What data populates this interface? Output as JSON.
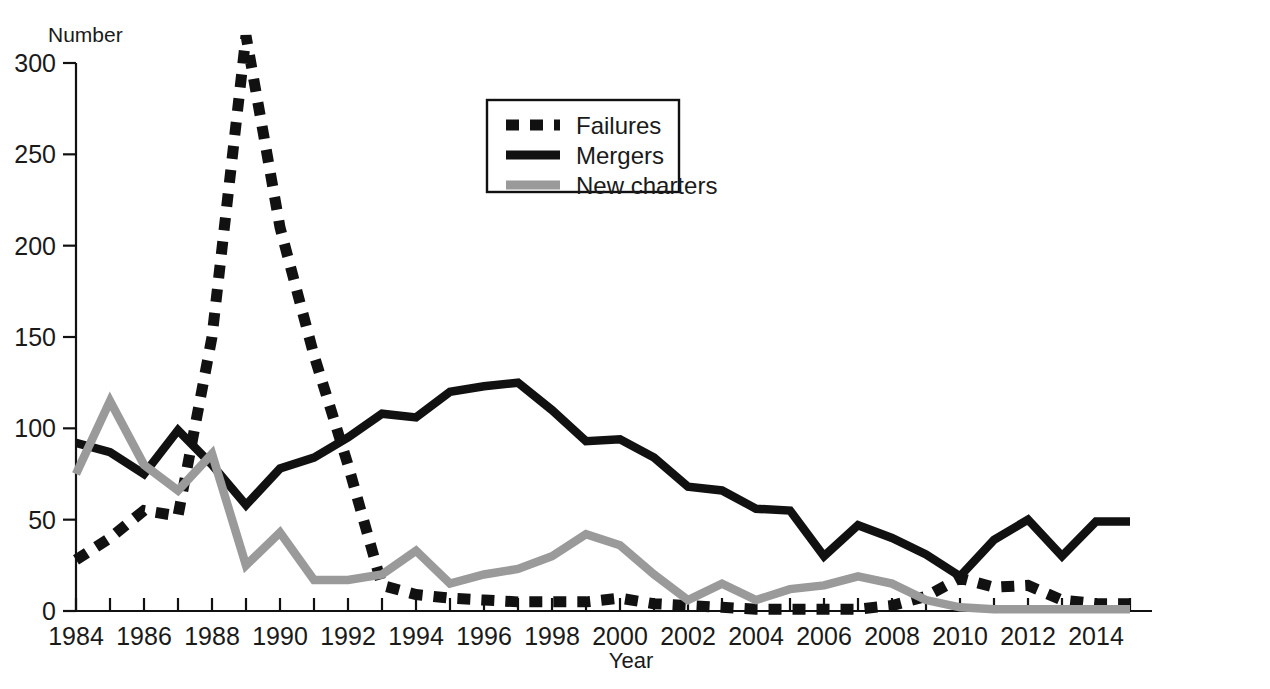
{
  "chart_data": {
    "type": "line",
    "title": "",
    "xlabel": "Year",
    "ylabel": "Number",
    "xlim": [
      1984,
      2015
    ],
    "ylim": [
      0,
      300
    ],
    "ytick_values": [
      0,
      50,
      100,
      150,
      200,
      250,
      300
    ],
    "ytick_labels": [
      "0",
      "50",
      "100",
      "150",
      "200",
      "250",
      "300"
    ],
    "xtick_values": [
      1984,
      1985,
      1986,
      1987,
      1988,
      1989,
      1990,
      1991,
      1992,
      1993,
      1994,
      1995,
      1996,
      1997,
      1998,
      1999,
      2000,
      2001,
      2002,
      2003,
      2004,
      2005,
      2006,
      2007,
      2008,
      2009,
      2010,
      2011,
      2012,
      2013,
      2014,
      2015
    ],
    "xtick_labels_shown": [
      "1984",
      "1986",
      "1988",
      "1990",
      "1992",
      "1994",
      "1996",
      "1998",
      "2000",
      "2002",
      "2004",
      "2006",
      "2008",
      "2010",
      "2012",
      "2014"
    ],
    "grid": false,
    "legend_position": "upper-center-left",
    "x": [
      1984,
      1985,
      1986,
      1987,
      1988,
      1989,
      1990,
      1991,
      1992,
      1993,
      1994,
      1995,
      1996,
      1997,
      1998,
      1999,
      2000,
      2001,
      2002,
      2003,
      2004,
      2005,
      2006,
      2007,
      2008,
      2009,
      2010,
      2011,
      2012,
      2013,
      2014,
      2015
    ],
    "series": [
      {
        "name": "Failures",
        "color": "#111111",
        "style": "dashed",
        "values": [
          28,
          40,
          55,
          52,
          150,
          315,
          210,
          140,
          80,
          14,
          9,
          7,
          6,
          5,
          5,
          5,
          7,
          4,
          3,
          2,
          1,
          1,
          1,
          1,
          3,
          8,
          18,
          13,
          14,
          6,
          4,
          4
        ]
      },
      {
        "name": "Mergers",
        "color": "#111111",
        "style": "solid",
        "values": [
          92,
          87,
          75,
          99,
          80,
          58,
          78,
          84,
          95,
          108,
          106,
          120,
          123,
          125,
          110,
          93,
          94,
          84,
          68,
          66,
          56,
          55,
          30,
          47,
          40,
          31,
          19,
          39,
          50,
          30,
          49,
          49
        ]
      },
      {
        "name": "New charters",
        "color": "#9a9a9a",
        "style": "solid",
        "values": [
          75,
          115,
          80,
          66,
          86,
          25,
          43,
          17,
          17,
          20,
          33,
          15,
          20,
          23,
          30,
          42,
          36,
          20,
          6,
          15,
          6,
          12,
          14,
          19,
          15,
          6,
          2,
          1,
          1,
          1,
          1,
          1
        ]
      }
    ]
  },
  "legend": {
    "items": [
      {
        "label": "Failures"
      },
      {
        "label": "Mergers"
      },
      {
        "label": "New charters"
      }
    ]
  },
  "axes": {
    "y_axis_title": "Number",
    "x_axis_title": "Year"
  }
}
